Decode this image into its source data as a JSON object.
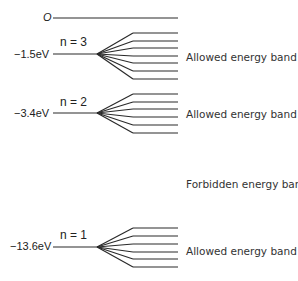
{
  "diagram": {
    "zero_level": {
      "label": "O",
      "y": 18
    },
    "levels": [
      {
        "n": "n = 3",
        "energy": "−1.5eV",
        "y": 54,
        "lines": [
          33,
          41,
          48,
          56,
          63,
          71,
          79
        ],
        "band_label": "Allowed energy band",
        "band_label_y": 57
      },
      {
        "n": "n = 2",
        "energy": "−3.4eV",
        "y": 113,
        "lines": [
          94,
          102,
          109,
          117,
          125,
          133
        ],
        "band_label": "Allowed energy band",
        "band_label_y": 114
      },
      {
        "n": "n = 1",
        "energy": "−13.6eV",
        "y": 247,
        "lines": [
          228,
          236,
          244,
          252,
          259,
          267
        ],
        "band_label": "Allowed energy band",
        "band_label_y": 251
      }
    ],
    "forbidden_label": "Forbidden energy band",
    "line_color": "#2a2a2a"
  }
}
